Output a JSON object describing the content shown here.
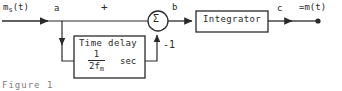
{
  "figure": {
    "caption": "Figure 1"
  },
  "labels": {
    "input_signal": "m",
    "input_signal_sub": "s",
    "input_signal_arg": "(t)",
    "node_a": "a",
    "node_b": "b",
    "node_c": "c",
    "plus_sign": "+",
    "feedback_gain": "-1",
    "summing_symbol": "Σ",
    "output_signal": "≃m(t)"
  },
  "blocks": {
    "integrator": {
      "label": "Integrator"
    },
    "time_delay": {
      "label": "Time delay",
      "numerator": "1",
      "denominator": "2f",
      "denominator_sub": "m",
      "units": "sec"
    }
  },
  "colors": {
    "line": "#2a2a2a",
    "background": "#ffffff",
    "caption": "#7d7d7d"
  }
}
